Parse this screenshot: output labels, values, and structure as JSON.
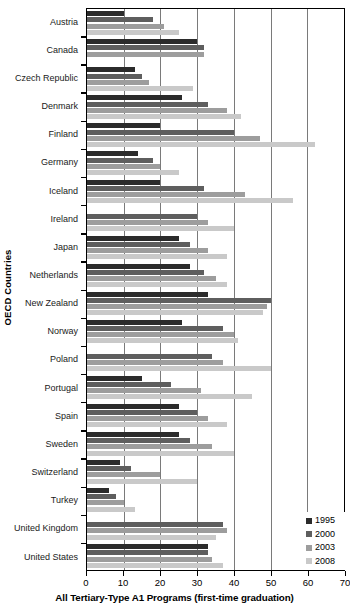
{
  "chart": {
    "type": "bar",
    "orientation": "horizontal-grouped",
    "ylabel": "OECD Countries",
    "xlabel": "All Tertiary-Type A1 Programs (first-time graduation)",
    "title": "",
    "xlim": [
      0,
      70
    ],
    "xticks": [
      0,
      10,
      20,
      30,
      40,
      50,
      60,
      70
    ],
    "grid": "vertical",
    "legend_position": "bottom-right"
  },
  "chart_data": {
    "type": "bar",
    "title": "",
    "xlabel": "All Tertiary-Type A1 Programs (first-time graduation)",
    "ylabel": "OECD Countries",
    "xlim": [
      0,
      70
    ],
    "xticks": [
      0,
      10,
      20,
      30,
      40,
      50,
      60,
      70
    ],
    "categories": [
      "Austria",
      "Canada",
      "Czech Republic",
      "Denmark",
      "Finland",
      "Germany",
      "Iceland",
      "Ireland",
      "Japan",
      "Netherlands",
      "New Zealand",
      "Norway",
      "Poland",
      "Portugal",
      "Spain",
      "Sweden",
      "Switzerland",
      "Turkey",
      "United Kingdom",
      "United States"
    ],
    "series": [
      {
        "name": "1995",
        "color": "#2b2b2b",
        "values": [
          10,
          30,
          13,
          26,
          20,
          14,
          20,
          null,
          25,
          28,
          33,
          26,
          null,
          15,
          25,
          25,
          9,
          6,
          null,
          33
        ]
      },
      {
        "name": "2000",
        "color": "#5e5e5e",
        "values": [
          18,
          32,
          15,
          33,
          40,
          18,
          32,
          30,
          28,
          32,
          50,
          37,
          34,
          23,
          30,
          28,
          12,
          8,
          37,
          33
        ]
      },
      {
        "name": "2003",
        "color": "#9d9d9d",
        "values": [
          21,
          32,
          17,
          38,
          47,
          20,
          43,
          33,
          33,
          35,
          49,
          40,
          37,
          31,
          33,
          34,
          20,
          10,
          38,
          34
        ]
      },
      {
        "name": "2008",
        "color": "#c9c9c9",
        "values": [
          25,
          null,
          29,
          42,
          62,
          25,
          56,
          40,
          38,
          38,
          48,
          41,
          50,
          45,
          38,
          40,
          30,
          13,
          35,
          37
        ]
      }
    ]
  },
  "legend": {
    "items": [
      {
        "label": "1995",
        "color": "#2b2b2b"
      },
      {
        "label": "2000",
        "color": "#5e5e5e"
      },
      {
        "label": "2003",
        "color": "#9d9d9d"
      },
      {
        "label": "2008",
        "color": "#c9c9c9"
      }
    ]
  }
}
